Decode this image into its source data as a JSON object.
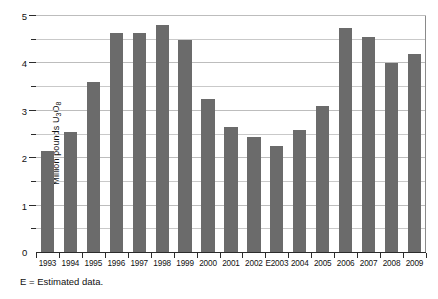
{
  "chart_data": {
    "type": "bar",
    "title": "",
    "subtitle": "",
    "xlabel": "",
    "ylabel": "Million pounds U3O8",
    "ylabel_parts": {
      "prefix": "Million pounds U",
      "sub1": "3",
      "mid": "O",
      "sub2": "8"
    },
    "categories": [
      "1993",
      "1994",
      "1995",
      "1996",
      "1997",
      "1998",
      "1999",
      "2000",
      "2001",
      "2002",
      "E2003",
      "2004",
      "2005",
      "2006",
      "2007",
      "2008",
      "2009"
    ],
    "values": [
      2.15,
      2.55,
      3.6,
      4.65,
      4.65,
      4.8,
      4.5,
      3.25,
      2.65,
      2.45,
      2.25,
      2.6,
      3.1,
      4.75,
      4.55,
      4.0,
      4.2
    ],
    "ylim": [
      0,
      5
    ],
    "ytick_labels": [
      "0",
      "1",
      "2",
      "3",
      "4",
      "5"
    ],
    "ytick_values": [
      0,
      1,
      2,
      3,
      4,
      5
    ],
    "minor_tick_values": [
      0.5,
      1.5,
      2.5,
      3.5,
      4.5
    ],
    "gridlines": [
      0.5,
      1,
      1.5,
      2,
      2.5,
      3,
      3.5,
      4,
      4.5,
      5
    ],
    "grid": true,
    "legend": null,
    "legend_position": "none",
    "bar_color": "#6b6b6b",
    "grid_color": "#c9c9c9",
    "axis_color": "#2b2b2b",
    "zero_label": "0",
    "footnote": "E = Estimated data."
  }
}
